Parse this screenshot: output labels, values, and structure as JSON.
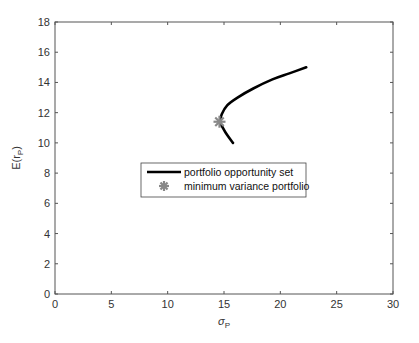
{
  "chart_data": {
    "type": "line",
    "title": "",
    "xlabel": "σP",
    "ylabel": "E(rP)",
    "xlim": [
      0,
      30
    ],
    "ylim": [
      0,
      18
    ],
    "xticks": [
      0,
      5,
      10,
      15,
      20,
      25,
      30
    ],
    "yticks": [
      0,
      2,
      4,
      6,
      8,
      10,
      12,
      14,
      16,
      18
    ],
    "grid": false,
    "legend_position": "center",
    "series": [
      {
        "name": "portfolio opportunity set",
        "style": "line",
        "color": "#000000",
        "points": [
          [
            15.8,
            10.0
          ],
          [
            15.3,
            10.5
          ],
          [
            14.9,
            11.0
          ],
          [
            14.65,
            11.4
          ],
          [
            14.8,
            11.9
          ],
          [
            15.3,
            12.5
          ],
          [
            16.2,
            13.0
          ],
          [
            17.6,
            13.6
          ],
          [
            19.3,
            14.2
          ],
          [
            20.8,
            14.6
          ],
          [
            22.3,
            15.0
          ]
        ]
      },
      {
        "name": "minimum variance portfolio",
        "style": "marker-asterisk",
        "color": "#888888",
        "points": [
          [
            14.6,
            11.4
          ]
        ]
      }
    ]
  }
}
